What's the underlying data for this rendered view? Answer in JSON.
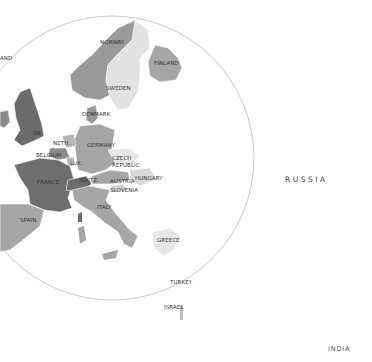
{
  "map": {
    "title": "Europe",
    "highlight_circle": {
      "cx": 120,
      "cy": 160,
      "r": 140,
      "stroke": "#bbbbbb"
    },
    "colors": {
      "dark": "#6b6b6b",
      "medium": "#8f8f8f",
      "light": "#b0b0b0",
      "pale": "#d2d2d2",
      "very_pale": "#e4e4e4",
      "border": "#ffffff"
    },
    "labels": {
      "iceland": "AND",
      "norway": "NORWAY",
      "sweden": "SWEDEN",
      "finland": "FINLAND",
      "denmark": "DENMARK",
      "uk": "UK",
      "neth": "NETH.",
      "belgium": "BELGIUM",
      "lux": "LUX.",
      "germany": "GERMANY",
      "czech1": "CZECH",
      "czech2": "REPUBLIC",
      "france": "FRANCE",
      "switz": "SWITZ.",
      "austria": "AUSTRIA",
      "hungary": "HUNGARY",
      "slovenia": "SLOVENIA",
      "italy": "ITALY",
      "spain": "SPAIN",
      "greece": "GREECE",
      "turkey": "TURKEY",
      "israel": "ISRAEL",
      "russia": "RUSSIA",
      "india": "INDIA"
    }
  }
}
